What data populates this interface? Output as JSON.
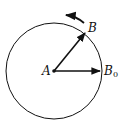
{
  "diagram": {
    "labels": {
      "center": "A",
      "point_b": "B",
      "point_b0_main": "B",
      "point_b0_sub": "0"
    },
    "colors": {
      "stroke": "#111111",
      "background": "#ffffff"
    }
  }
}
